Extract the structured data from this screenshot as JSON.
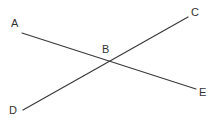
{
  "diagram": {
    "type": "intersecting-lines",
    "colors": {
      "line": "#3a3a3a",
      "label": "#333333",
      "background": "#ffffff"
    },
    "points": {
      "A": {
        "label": "A",
        "x": 22,
        "y": 33,
        "label_x": 11,
        "label_y": 27
      },
      "B": {
        "label": "B",
        "x": 108,
        "y": 61,
        "label_x": 102,
        "label_y": 53
      },
      "C": {
        "label": "C",
        "x": 188,
        "y": 17,
        "label_x": 191,
        "label_y": 16
      },
      "D": {
        "label": "D",
        "x": 23,
        "y": 110,
        "label_x": 9,
        "label_y": 114
      },
      "E": {
        "label": "E",
        "x": 196,
        "y": 89,
        "label_x": 199,
        "label_y": 96
      }
    },
    "segments": [
      {
        "name": "segment-AE",
        "from": "A",
        "to": "E",
        "through": "B"
      },
      {
        "name": "segment-DC",
        "from": "D",
        "to": "C",
        "through": "B"
      }
    ]
  }
}
